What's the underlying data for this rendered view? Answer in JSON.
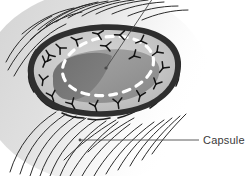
{
  "figure": {
    "title": "Capsule",
    "type": "medical-illustration",
    "width": 250,
    "height": 176,
    "background_color": "#ffffff"
  },
  "labels": [
    {
      "id": "capsule",
      "text": "Capsule",
      "text_x": 203,
      "text_y": 144,
      "leader": {
        "x1": 80,
        "y1": 140,
        "x2": 199,
        "y2": 140
      },
      "dot": {
        "cx": 80,
        "cy": 140,
        "r": 1.4
      },
      "color": "#3a3a3a"
    },
    {
      "id": "lesion-pointer",
      "text": "",
      "leader": {
        "x1": 153,
        "y1": -2,
        "x2": 106,
        "y2": 68
      },
      "dot": {
        "cx": 106,
        "cy": 68,
        "r": 1.6
      },
      "color": "#3a3a3a"
    }
  ],
  "colors": {
    "capsule_rim": "#2e2e2e",
    "capsule_rim_highlight": "#5a5a5a",
    "capsule_fill": "#c9c9c9",
    "mass_light": "#9c9c9c",
    "mass_dark": "#767676",
    "dashed_incision": "#ffffff",
    "suture_stroke": "#141414",
    "fiber_stroke": "#2b2b2b",
    "tissue_haze": "#d8d8d8",
    "label_text": "#3a3a3a",
    "leader_line": "#4a4a4a"
  },
  "structures": {
    "capsule_rim_label": "capsule-rim",
    "mass_label": "encapsulated-mass",
    "dashed_incision_label": "dashed-incision-outline",
    "suture_count": 18,
    "top_fiber_count": 14,
    "bottom_fiber_count": 16,
    "capsule_arc_count": 10
  },
  "geometry": {
    "capsule_outer_path": "M 28,74 C 26,56 40,40 62,32 C 86,23 116,22 144,28 C 166,33 180,45 181,62 C 182,80 172,96 152,106 C 128,118 92,120 64,112 C 42,106 30,92 28,74 Z",
    "capsule_inner_path": "M 34,74 C 32,58 45,44 65,37 C 88,29 115,28 141,33 C 161,38 174,48 175,63 C 176,79 166,93 148,102 C 126,112 93,114 67,107 C 47,101 36,89 34,74 Z",
    "mass_path": "M 53,78 C 52,66 64,57 82,53 C 104,48 130,48 146,54 C 158,59 162,68 158,78 C 153,90 136,99 114,102 C 90,105 68,101 58,93 C 53,89 53,84 53,78 Z",
    "mass_dark_path": "M 53,78 C 52,68 62,59 78,55 C 92,52 104,52 112,56 C 108,70 100,84 88,94 C 76,103 62,101 57,94 C 53,90 53,84 53,78 Z",
    "dashed_ellipse": {
      "cx": 108,
      "cy": 66,
      "rx": 46,
      "ry": 29,
      "rotate": -10
    }
  },
  "sutures": [
    {
      "x": 45,
      "y": 62,
      "r": 22
    },
    {
      "x": 43,
      "y": 80,
      "r": 8
    },
    {
      "x": 52,
      "y": 96,
      "r": -18
    },
    {
      "x": 72,
      "y": 104,
      "r": -30
    },
    {
      "x": 95,
      "y": 106,
      "r": -18
    },
    {
      "x": 118,
      "y": 103,
      "r": -8
    },
    {
      "x": 140,
      "y": 96,
      "r": 14
    },
    {
      "x": 156,
      "y": 84,
      "r": 26
    },
    {
      "x": 163,
      "y": 68,
      "r": 38
    },
    {
      "x": 157,
      "y": 52,
      "r": 54
    },
    {
      "x": 141,
      "y": 41,
      "r": 70
    },
    {
      "x": 120,
      "y": 35,
      "r": 92
    },
    {
      "x": 98,
      "y": 34,
      "r": 104
    },
    {
      "x": 76,
      "y": 40,
      "r": 118
    },
    {
      "x": 60,
      "y": 48,
      "r": 134
    },
    {
      "x": 49,
      "y": 55,
      "r": 148
    },
    {
      "x": 106,
      "y": 46,
      "r": 96
    },
    {
      "x": 134,
      "y": 56,
      "r": 60
    }
  ],
  "top_fibers": [
    "M 6,62 C 16,42 32,26 52,16",
    "M 8,70 C 20,48 38,30 58,20",
    "M 14,76 C 26,54 44,34 66,24",
    "M 22,34 C 36,22 54,12 74,8",
    "M 30,40 C 44,26 62,16 82,12",
    "M 38,30 C 52,18 70,8 90,4",
    "M 46,26 C 60,14 78,6 98,2",
    "M 56,22 C 70,12 88,4 108,1",
    "M 68,18 C 82,10 100,3 120,0",
    "M 82,16 C 96,8 114,2 134,0",
    "M 96,14 C 110,7 128,2 148,0",
    "M 112,14 C 126,8 144,3 164,2",
    "M 128,16 C 142,10 160,6 178,6",
    "M 142,20 C 156,14 172,10 188,10"
  ],
  "bottom_fibers": [
    "M 10,172 C 18,146 34,126 56,112",
    "M 20,174 C 28,148 44,128 66,114",
    "M 30,176 C 38,150 54,130 76,116",
    "M 40,176 C 48,152 64,132 86,118",
    "M 50,176 C 58,154 74,134 96,120",
    "M 60,176 C 68,156 84,136 106,121",
    "M 70,176 C 80,158 96,138 118,122",
    "M 82,176 C 92,158 108,140 130,124",
    "M 94,176 C 104,158 120,140 142,124",
    "M 106,174 C 116,156 132,138 154,122",
    "M 118,170 C 128,152 144,134 164,120",
    "M 130,166 C 140,148 154,132 172,118",
    "M 142,160 C 152,144 164,130 180,116",
    "M 152,154 C 162,140 172,128 186,114",
    "M 88,152 C 100,140 116,128 134,118",
    "M 64,160 C 78,146 96,132 116,120"
  ],
  "capsule_arcs": [
    "M 36,52 C 42,46 50,42 58,40",
    "M 30,70 C 30,62 32,56 36,50",
    "M 34,92 C 30,86 28,78 29,72",
    "M 58,110 C 50,108 42,102 38,96",
    "M 84,118 C 76,118 68,116 62,113",
    "M 110,118 C 102,120 94,120 88,119",
    "M 140,108 C 134,113 126,116 118,118",
    "M 166,88 C 164,96 158,103 150,108",
    "M 176,62 C 180,70 180,78 176,86",
    "M 156,36 C 166,42 172,50 175,58"
  ]
}
